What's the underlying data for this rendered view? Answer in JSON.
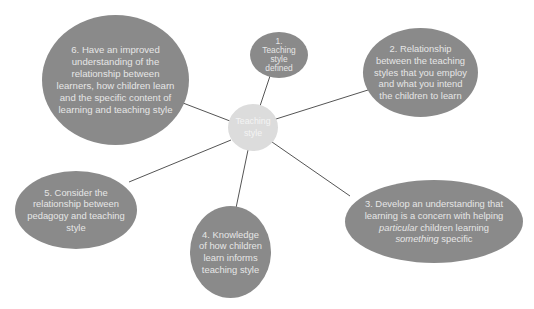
{
  "diagram": {
    "type": "mind-map",
    "colors": {
      "background": "#ffffff",
      "outer_node": "#8a8a8a",
      "center_node": "#dcdcdc",
      "outer_text": "#e6e6e6",
      "center_text": "#f4f4f4",
      "connector": "#555555"
    },
    "center": {
      "label_line1": "Teaching",
      "label_line2": "style"
    },
    "nodes": [
      {
        "id": 1,
        "lines": [
          "1.",
          "Teaching",
          "style",
          "defined"
        ]
      },
      {
        "id": 2,
        "lines": [
          "2. Relationship",
          "between the teaching",
          "styles that you employ",
          "and what you intend",
          "the children to learn"
        ]
      },
      {
        "id": 3,
        "line1": "3. Develop an understanding that",
        "line2": "learning is a concern with helping",
        "line3_italic": "particular",
        "line3_rest": " children learning",
        "line4_italic": "something",
        "line4_rest": " specific"
      },
      {
        "id": 4,
        "lines": [
          "4. Knowledge",
          "of how children",
          "learn informs",
          "teaching style"
        ]
      },
      {
        "id": 5,
        "lines": [
          "5. Consider the",
          "relationship between",
          "pedagogy and teaching",
          "style"
        ]
      },
      {
        "id": 6,
        "lines": [
          "6. Have an improved",
          "understanding of the",
          "relationship between",
          "learners, how children learn",
          "and the specific content of",
          "learning and teaching style"
        ]
      }
    ]
  }
}
